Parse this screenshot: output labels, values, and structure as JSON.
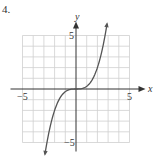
{
  "problem_number": "4.",
  "chart_data": {
    "type": "line",
    "title": "",
    "xlabel": "x",
    "ylabel": "y",
    "xlim": [
      -5,
      5
    ],
    "ylim": [
      -5,
      5
    ],
    "grid": true,
    "x_ticks_labeled": [
      {
        "value": -5,
        "label": "−5"
      },
      {
        "value": 5,
        "label": "5"
      }
    ],
    "y_ticks_labeled": [
      {
        "value": 5,
        "label": "5"
      },
      {
        "value": -5,
        "label": "−5"
      }
    ],
    "series": [
      {
        "name": "curve",
        "function": "y = x^3/4",
        "x": [
          -2.9,
          -2.5,
          -2,
          -1.5,
          -1,
          -0.5,
          0,
          0.5,
          1,
          1.5,
          2,
          2.5,
          2.9
        ],
        "y": [
          -6.1,
          -3.91,
          -2,
          -0.84,
          -0.25,
          -0.03,
          0,
          0.03,
          0.25,
          0.84,
          2,
          3.91,
          6.1
        ],
        "endpoints": "arrows"
      }
    ]
  },
  "colors": {
    "grid": "#cfcfcf",
    "axis": "#333333",
    "curve": "#555555"
  }
}
